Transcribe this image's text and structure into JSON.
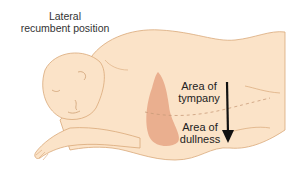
{
  "figure": {
    "title": {
      "line1": "Lateral",
      "line2": "recumbent position"
    },
    "labels": {
      "tympany": {
        "line1": "Area of",
        "line2": "tympany"
      },
      "dullness": {
        "line1": "Area of",
        "line2": "dullness"
      }
    },
    "colors": {
      "skin": "#fbe3c8",
      "outline": "#d9a878",
      "dullness_region": "#e8a888",
      "arrow": "#111111",
      "dashed_line": "#c89a78"
    },
    "icons": {
      "arrow": "down-arrow-icon"
    }
  }
}
